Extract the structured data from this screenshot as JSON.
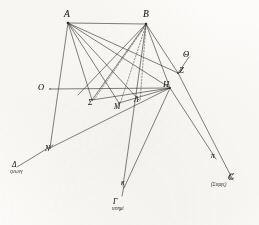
{
  "figure": {
    "kind": "geometric-diagram",
    "ink_color": "#2f2d2a",
    "paper_color": "#fcfbf9",
    "width": 259,
    "height": 225,
    "points": [
      {
        "id": "A",
        "label": "A",
        "x": 68,
        "y": 23,
        "label_x": 64,
        "label_y": 10,
        "size": "main"
      },
      {
        "id": "B",
        "label": "B",
        "x": 146,
        "y": 24,
        "label_x": 143,
        "label_y": 10,
        "size": "main"
      },
      {
        "id": "Theta",
        "label": "Θ",
        "x": 188,
        "y": 59,
        "label_x": 183,
        "label_y": 50,
        "size": "mid"
      },
      {
        "id": "Z",
        "label": "Z",
        "x": 177,
        "y": 73,
        "label_x": 179,
        "label_y": 66,
        "size": "mid"
      },
      {
        "id": "H",
        "label": "H",
        "x": 170,
        "y": 88,
        "label_x": 163,
        "label_y": 81,
        "size": "mid"
      },
      {
        "id": "O",
        "label": "O",
        "x": 50,
        "y": 89,
        "label_x": 39,
        "label_y": 83,
        "size": "mid"
      },
      {
        "id": "Sigma",
        "label": "Σ",
        "x": 92,
        "y": 100,
        "label_x": 88,
        "label_y": 99,
        "size": "small"
      },
      {
        "id": "M",
        "label": "M",
        "x": 119,
        "y": 103,
        "label_x": 115,
        "label_y": 103,
        "size": "small"
      },
      {
        "id": "Lambda",
        "label": "Λ",
        "x": 139,
        "y": 100,
        "label_x": 135,
        "label_y": 97,
        "size": "small"
      },
      {
        "id": "N",
        "label": "N",
        "x": 50,
        "y": 148,
        "label_x": 46,
        "label_y": 145,
        "size": "small"
      },
      {
        "id": "kappa",
        "label": "κ",
        "x": 123,
        "y": 184,
        "label_x": 122,
        "label_y": 180,
        "size": "small"
      },
      {
        "id": "pi",
        "label": "π",
        "x": 214,
        "y": 157,
        "label_x": 212,
        "label_y": 153,
        "size": "small"
      },
      {
        "id": "C",
        "label": "C",
        "x": 231,
        "y": 178,
        "label_x": 229,
        "label_y": 174,
        "size": "small"
      }
    ],
    "annotated_labels": [
      {
        "id": "delta-annot",
        "head": "Δ",
        "sub": "ςιεωνγ",
        "x": 10,
        "y": 163
      },
      {
        "id": "gamma-annot",
        "head": "Γ",
        "sub": "ιεσημί",
        "x": 112,
        "y": 200
      },
      {
        "id": "sigma-annot",
        "head": "C",
        "sub": "(Σιεμγς)",
        "x": 211,
        "y": 176
      }
    ],
    "segments_solid": [
      {
        "from": "A",
        "to": "B",
        "name": "segment-AB"
      },
      {
        "from": "A",
        "to": "Sigma",
        "name": "segment-A-Sigma"
      },
      {
        "from": "A",
        "to": "M",
        "name": "segment-A-M"
      },
      {
        "from": "A",
        "to": "Lambda",
        "name": "segment-A-Lambda"
      },
      {
        "from": "A",
        "to": "H",
        "name": "segment-A-H"
      },
      {
        "from": "A",
        "to": "Z",
        "name": "segment-A-Z"
      },
      {
        "from": "A",
        "to": "N",
        "name": "segment-A-N"
      },
      {
        "from": "B",
        "to": "Sigma",
        "name": "segment-B-Sigma"
      },
      {
        "from": "B",
        "to": "O",
        "name": "segment-B-O"
      },
      {
        "from": "B",
        "to": "M",
        "name": "segment-B-M"
      },
      {
        "from": "B",
        "to": "H",
        "name": "segment-B-H"
      },
      {
        "from": "B",
        "to": "Z",
        "name": "segment-B-Z"
      },
      {
        "from": "B",
        "to": "kappa",
        "name": "segment-B-kappa"
      },
      {
        "from": "O",
        "to": "H",
        "name": "segment-O-H"
      },
      {
        "from": "Sigma",
        "to": "H",
        "name": "segment-Sigma-H"
      },
      {
        "from": "M",
        "to": "H",
        "name": "segment-M-H"
      },
      {
        "from": "Z",
        "to": "Theta",
        "name": "segment-Z-Theta"
      },
      {
        "from": "H",
        "to": "kappa",
        "name": "segment-H-kappa"
      },
      {
        "from": "H",
        "to": "pi",
        "name": "segment-H-pi"
      },
      {
        "from": "Z",
        "to": "C",
        "name": "segment-Z-C"
      },
      {
        "from": "N",
        "to": "H",
        "name": "segment-N-H"
      },
      {
        "from": "N",
        "to": "delta",
        "name": "segment-N-delta"
      }
    ],
    "segments_dashed": [
      {
        "from": "B",
        "to": "Sigma",
        "name": "dashed-B-Sigma"
      },
      {
        "from": "B",
        "to": "M",
        "name": "dashed-B-M"
      },
      {
        "from": "B",
        "to": "Lambda",
        "name": "dashed-B-Lambda"
      }
    ]
  }
}
